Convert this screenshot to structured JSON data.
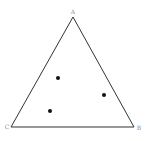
{
  "diagram": {
    "type": "triangle-with-points",
    "vertices": [
      {
        "label": "A",
        "x": 73,
        "y": 17,
        "label_x": 73,
        "label_y": 14
      },
      {
        "label": "B",
        "x": 134,
        "y": 127,
        "label_x": 139,
        "label_y": 130
      },
      {
        "label": "C",
        "x": 11,
        "y": 127,
        "label_x": 7,
        "label_y": 129
      }
    ],
    "points": [
      {
        "x": 58,
        "y": 78
      },
      {
        "x": 104,
        "y": 95
      },
      {
        "x": 50,
        "y": 111
      }
    ],
    "colors": {
      "stroke": "#333333",
      "point": "#111111",
      "label": "#888888"
    }
  }
}
